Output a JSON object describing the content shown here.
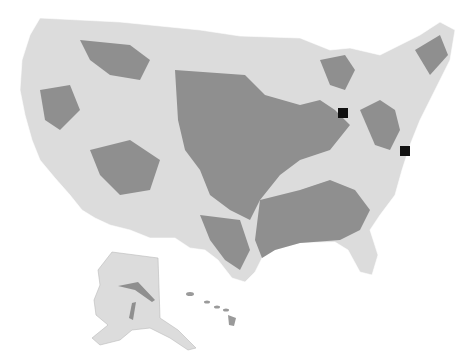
{
  "map": {
    "subject": "United States map with shaded regions",
    "colors": {
      "background": "#ffffff",
      "land_light": "#dcdcdc",
      "region_dark": "#8f8f8f",
      "state_border": "#ffffff",
      "marker": "#111111"
    },
    "markers": [
      {
        "name": "marker-michigan-ohio",
        "x": 343,
        "y": 113,
        "size": 10
      },
      {
        "name": "marker-mid-atlantic",
        "x": 405,
        "y": 151,
        "size": 10
      }
    ],
    "insets": [
      "Alaska",
      "Hawaii"
    ]
  }
}
